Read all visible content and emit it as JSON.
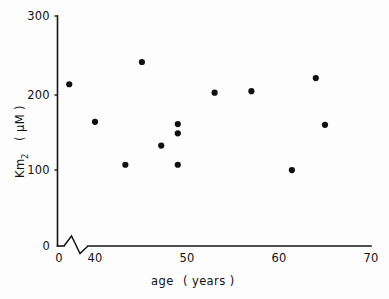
{
  "chart_data": {
    "type": "scatter",
    "title": "",
    "xlabel": "age  ( years )",
    "ylabel": "Km2  ( µM )",
    "ylabel_main": "Km",
    "ylabel_subscript": "2",
    "ylabel_units": "( µM )",
    "xlabel_main": "age",
    "xlabel_units": "( years )",
    "xlim": [
      0,
      70
    ],
    "ylim": [
      0,
      300
    ],
    "x_ticks": [
      0,
      40,
      50,
      60,
      70
    ],
    "x_tick_labels": [
      "0",
      "40",
      "50",
      "60",
      "70"
    ],
    "y_ticks": [
      0,
      100,
      200,
      300
    ],
    "y_tick_labels": [
      "0",
      "100",
      "200",
      "300"
    ],
    "axis_break": {
      "present": true,
      "axis": "x",
      "note": "zigzag break between 0 and 40 on the x axis"
    },
    "grid": false,
    "legend": false,
    "marker": "filled-circle",
    "marker_color": "#101010",
    "series": [
      {
        "name": "Km2 vs age",
        "points": [
          {
            "x": 37.2,
            "y": 211
          },
          {
            "x": 40.0,
            "y": 162
          },
          {
            "x": 43.3,
            "y": 106
          },
          {
            "x": 45.1,
            "y": 240
          },
          {
            "x": 47.2,
            "y": 131
          },
          {
            "x": 49.0,
            "y": 159
          },
          {
            "x": 49.0,
            "y": 147
          },
          {
            "x": 49.0,
            "y": 106
          },
          {
            "x": 53.0,
            "y": 200
          },
          {
            "x": 57.0,
            "y": 202
          },
          {
            "x": 61.4,
            "y": 99
          },
          {
            "x": 64.0,
            "y": 219
          },
          {
            "x": 65.0,
            "y": 158
          }
        ]
      }
    ]
  },
  "axes": {
    "y_tick_300": "300",
    "y_tick_200": "200",
    "y_tick_100": "100",
    "y_tick_0": "0",
    "x_tick_0": "0",
    "x_tick_40": "40",
    "x_tick_50": "50",
    "x_tick_60": "60",
    "x_tick_70": "70"
  }
}
